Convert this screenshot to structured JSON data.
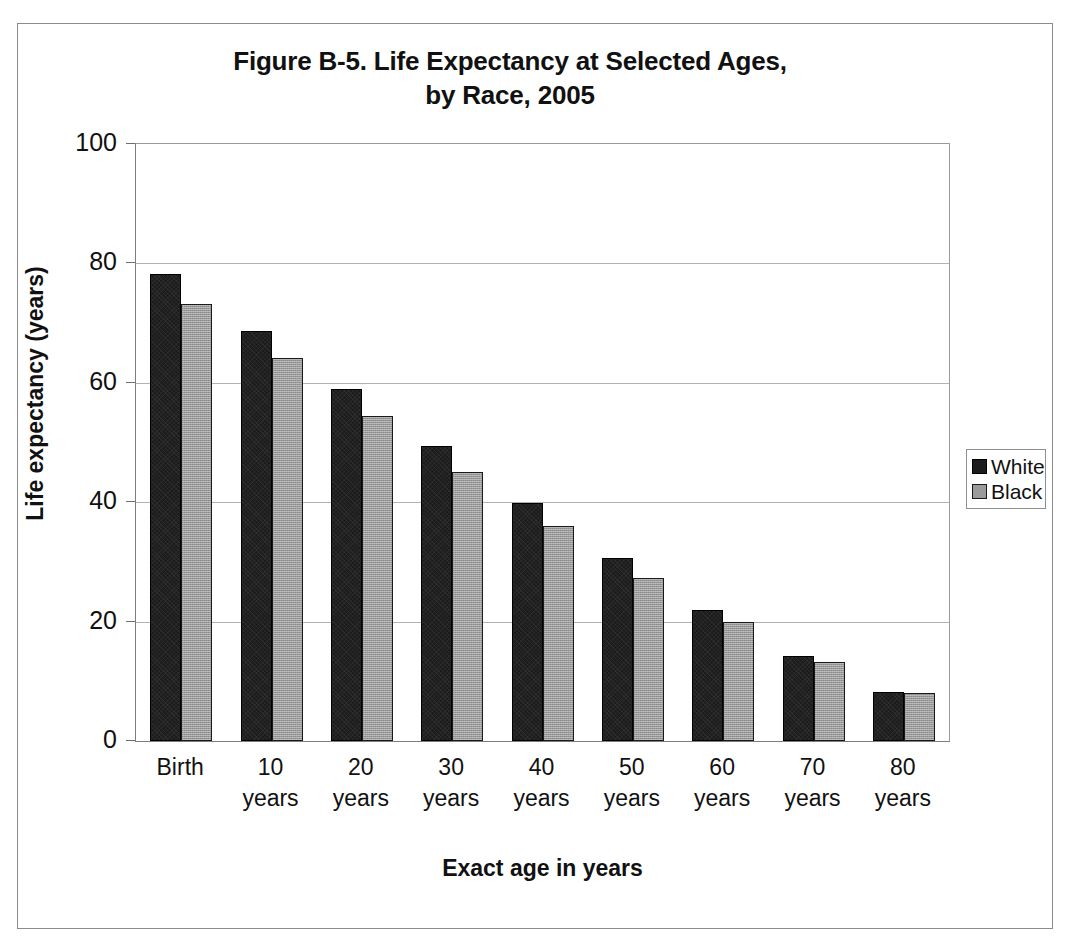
{
  "figure": {
    "title_line1": "Figure B-5. Life Expectancy at Selected Ages,",
    "title_line2": "by Race, 2005"
  },
  "legend": {
    "position": "right",
    "entries": [
      {
        "label": "White",
        "color": "#1c1c1c"
      },
      {
        "label": "Black",
        "color": "#9a9a9a"
      }
    ]
  },
  "axes": {
    "y_title": "Life expectancy (years)",
    "x_title": "Exact age in years",
    "y_ticks": [
      "100",
      "80",
      "60",
      "40",
      "20",
      "0"
    ],
    "x_tick_labels": [
      {
        "line1": "Birth",
        "line2": ""
      },
      {
        "line1": "10",
        "line2": "years"
      },
      {
        "line1": "20",
        "line2": "years"
      },
      {
        "line1": "30",
        "line2": "years"
      },
      {
        "line1": "40",
        "line2": "years"
      },
      {
        "line1": "50",
        "line2": "years"
      },
      {
        "line1": "60",
        "line2": "years"
      },
      {
        "line1": "70",
        "line2": "years"
      },
      {
        "line1": "80",
        "line2": "years"
      }
    ]
  },
  "chart_data": {
    "type": "bar",
    "title": "Figure B-5. Life Expectancy at Selected Ages, by Race, 2005",
    "xlabel": "Exact age in years",
    "ylabel": "Life expectancy (years)",
    "ylim": [
      0,
      100
    ],
    "ytick_values": [
      0,
      20,
      40,
      60,
      80,
      100
    ],
    "grid": true,
    "legend_position": "right",
    "categories": [
      "Birth",
      "10 years",
      "20 years",
      "30 years",
      "40 years",
      "50 years",
      "60 years",
      "70 years",
      "80 years"
    ],
    "series": [
      {
        "name": "White",
        "color": "#1c1c1c",
        "values": [
          78.3,
          68.7,
          59.0,
          49.4,
          39.8,
          30.7,
          22.0,
          14.3,
          8.2
        ]
      },
      {
        "name": "Black",
        "color": "#9a9a9a",
        "values": [
          73.2,
          64.2,
          54.5,
          45.1,
          36.0,
          27.3,
          19.9,
          13.3,
          8.1
        ]
      }
    ]
  }
}
